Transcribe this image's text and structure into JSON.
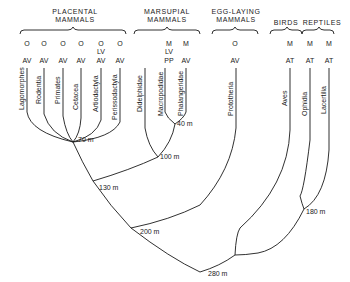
{
  "groups": [
    {
      "label_line1": "PLACENTAL",
      "label_line2": "MAMMALS"
    },
    {
      "label_line1": "MARSUPIAL",
      "label_line2": "MAMMALS"
    },
    {
      "label_line1": "EGG-LAYING",
      "label_line2": "MAMMALS"
    },
    {
      "label_line1": "BIRDS",
      "label_line2": ""
    },
    {
      "label_line1": "REPTILES",
      "label_line2": ""
    }
  ],
  "taxa": [
    {
      "name": "Lagomorphes",
      "top_code": "O",
      "mid_code": "",
      "bottom_code": "AV"
    },
    {
      "name": "Rodentia",
      "top_code": "O",
      "mid_code": "",
      "bottom_code": "AV"
    },
    {
      "name": "Primates",
      "top_code": "O",
      "mid_code": "",
      "bottom_code": "AV"
    },
    {
      "name": "Cetacea",
      "top_code": "O",
      "mid_code": "",
      "bottom_code": "AV"
    },
    {
      "name": "Artiodactyla",
      "top_code": "O",
      "mid_code": "LV",
      "bottom_code": "AV"
    },
    {
      "name": "Perissodactyla",
      "top_code": "O",
      "mid_code": "",
      "bottom_code": "AV"
    },
    {
      "name": "Didelphidae",
      "top_code": "",
      "mid_code": "",
      "bottom_code": ""
    },
    {
      "name": "Macropodidae",
      "top_code": "M",
      "mid_code": "LV",
      "bottom_code": "PP"
    },
    {
      "name": "Phalangeridae",
      "top_code": "M",
      "mid_code": "",
      "bottom_code": "AV"
    },
    {
      "name": "Prototheria",
      "top_code": "O",
      "mid_code": "",
      "bottom_code": "AV"
    },
    {
      "name": "Aves",
      "top_code": "M",
      "mid_code": "",
      "bottom_code": "AT"
    },
    {
      "name": "Ophidia",
      "top_code": "M",
      "mid_code": "",
      "bottom_code": "AT"
    },
    {
      "name": "Lacertilia",
      "top_code": "M",
      "mid_code": "",
      "bottom_code": "AT"
    }
  ],
  "divergence_ages": {
    "placental": "70 m",
    "marsupial_split": "40 m",
    "marsupial": "100 m",
    "therian": "130 m",
    "mammal": "200 m",
    "reptile_bird": "180 m",
    "root": "280 m"
  }
}
